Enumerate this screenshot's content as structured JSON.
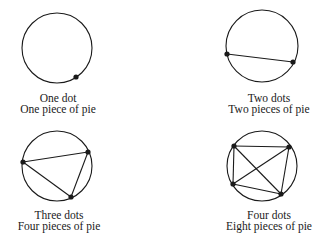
{
  "colors": {
    "stroke": "#1a1a1a",
    "background": "#ffffff"
  },
  "panels": [
    {
      "id": "one-dot",
      "label_dots": "One dot",
      "label_pieces": "One piece of pie",
      "dots": 1,
      "pieces": 1,
      "circle": {
        "cx": 57,
        "cy": 48,
        "r": 35
      },
      "points": [
        [
          76,
          77
        ]
      ]
    },
    {
      "id": "two-dots",
      "label_dots": "Two dots",
      "label_pieces": "Two pieces of pie",
      "dots": 2,
      "pieces": 2,
      "circle": {
        "cx": 262,
        "cy": 46,
        "r": 36
      },
      "points": [
        [
          227,
          54
        ],
        [
          293,
          62
        ]
      ]
    },
    {
      "id": "three-dots",
      "label_dots": "Three dots",
      "label_pieces": "Four pieces of pie",
      "dots": 3,
      "pieces": 4,
      "circle": {
        "cx": 57,
        "cy": 166,
        "r": 35
      },
      "points": [
        [
          23,
          162
        ],
        [
          88,
          152
        ],
        [
          71,
          197
        ]
      ]
    },
    {
      "id": "four-dots",
      "label_dots": "Four dots",
      "label_pieces": "Eight pieces of pie",
      "dots": 4,
      "pieces": 8,
      "circle": {
        "cx": 262,
        "cy": 166,
        "r": 35
      },
      "points": [
        [
          234,
          146
        ],
        [
          289,
          147
        ],
        [
          233,
          184
        ],
        [
          281,
          194
        ]
      ]
    }
  ]
}
